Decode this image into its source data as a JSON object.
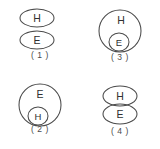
{
  "figure": {
    "background_color": "#ffffff",
    "stroke_color": "#4a4a4a",
    "text_color": "#303030",
    "panels": [
      {
        "id": "panel-1",
        "caption": "( 1 )",
        "description": "Two separate ellipses, H above E, not touching",
        "shapes": [
          {
            "kind": "ellipse",
            "label": "H",
            "cx": 37,
            "cy": 18,
            "rx": 17,
            "ry": 9
          },
          {
            "kind": "ellipse",
            "label": "E",
            "cx": 37,
            "cy": 40,
            "rx": 17,
            "ry": 9
          }
        ]
      },
      {
        "id": "panel-2",
        "caption": "( 2 )",
        "description": "Large circle labeled E containing a small circle labeled H",
        "shapes": [
          {
            "kind": "circle",
            "label": "E",
            "cx": 40,
            "cy": 31,
            "rx": 21,
            "ry": 21,
            "label_cx": 40,
            "label_cy": 20
          },
          {
            "kind": "circle",
            "label": "H",
            "cx": 38,
            "cy": 42,
            "rx": 10,
            "ry": 9
          }
        ]
      },
      {
        "id": "panel-3",
        "caption": "( 3 )",
        "description": "Large circle labeled H containing a small circle labeled E",
        "shapes": [
          {
            "kind": "circle",
            "label": "H",
            "cx": 40,
            "cy": 31,
            "rx": 21,
            "ry": 21,
            "label_cx": 41,
            "label_cy": 20
          },
          {
            "kind": "circle",
            "label": "E",
            "cx": 39,
            "cy": 42,
            "rx": 10,
            "ry": 9
          }
        ]
      },
      {
        "id": "panel-4",
        "caption": "( 4 )",
        "description": "Two ellipses, H above E, touching and slightly overlapping",
        "shapes": [
          {
            "kind": "ellipse",
            "label": "H",
            "cx": 40,
            "cy": 22,
            "rx": 17,
            "ry": 10
          },
          {
            "kind": "ellipse",
            "label": "E",
            "cx": 40,
            "cy": 40,
            "rx": 17,
            "ry": 10
          }
        ]
      }
    ]
  }
}
